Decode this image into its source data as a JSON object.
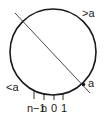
{
  "diagram": {
    "type": "number-circle",
    "labels": {
      "greater": ">a",
      "less": "<a",
      "point": "a"
    },
    "ticks": [
      "n−1",
      "n",
      "0",
      "1"
    ],
    "colors": {
      "stroke": "#1a1a1a",
      "background": "#ffffff"
    }
  }
}
